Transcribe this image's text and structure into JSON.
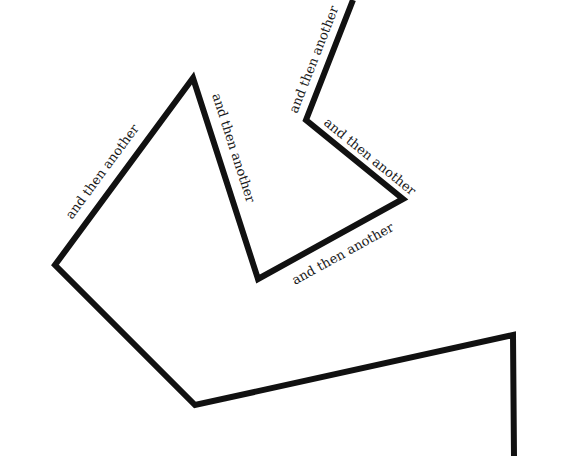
{
  "illustration": {
    "line_color": "#111111",
    "background": "#ffffff",
    "stroke_width": 6,
    "path_points": [
      [
        353,
        0
      ],
      [
        306,
        120
      ],
      [
        403,
        199
      ],
      [
        258,
        279
      ],
      [
        193,
        78
      ],
      [
        55,
        265
      ],
      [
        195,
        405
      ],
      [
        513,
        335
      ],
      [
        514,
        456
      ]
    ],
    "labels": [
      {
        "text": "and then another",
        "x": 297,
        "y": 114,
        "rotate": -68.6
      },
      {
        "text": "and then another",
        "x": 323,
        "y": 124,
        "rotate": 39.2
      },
      {
        "text": "and then another",
        "x": 295,
        "y": 285,
        "rotate": -28.9
      },
      {
        "text": "and then another",
        "x": 212,
        "y": 95,
        "rotate": 72.1
      },
      {
        "text": "and then another",
        "x": 72,
        "y": 220,
        "rotate": -53.6
      }
    ]
  }
}
